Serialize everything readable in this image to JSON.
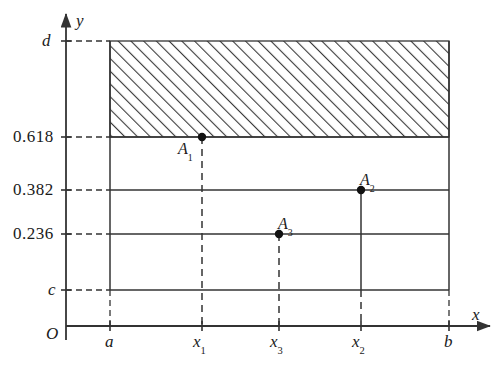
{
  "figure": {
    "type": "cartesian-diagram",
    "axes": {
      "x_label": "x",
      "y_label": "y",
      "origin_label": "O"
    },
    "y_ticks": [
      {
        "id": "d",
        "label": "d",
        "pixel_y": 41,
        "style": "italic"
      },
      {
        "id": "0.618",
        "label": "0.618",
        "pixel_y": 137,
        "style": "number"
      },
      {
        "id": "0.382",
        "label": "0.382",
        "pixel_y": 190,
        "style": "number"
      },
      {
        "id": "0.236",
        "label": "0.236",
        "pixel_y": 234,
        "style": "number"
      },
      {
        "id": "c",
        "label": "c",
        "pixel_y": 290,
        "style": "italic"
      }
    ],
    "x_ticks": [
      {
        "id": "a",
        "label": "a",
        "sub": "",
        "pixel_x": 110
      },
      {
        "id": "x1",
        "label": "x",
        "sub": "1",
        "pixel_x": 202
      },
      {
        "id": "x3",
        "label": "x",
        "sub": "3",
        "pixel_x": 279
      },
      {
        "id": "x2",
        "label": "x",
        "sub": "2",
        "pixel_x": 361
      },
      {
        "id": "b",
        "label": "b",
        "sub": "",
        "pixel_x": 449
      }
    ],
    "points": [
      {
        "id": "A1",
        "label": "A",
        "sub": "1",
        "x_tick": "x1",
        "y_tick": "0.618",
        "pixel_x": 202,
        "pixel_y": 137
      },
      {
        "id": "A2",
        "label": "A",
        "sub": "2",
        "x_tick": "x2",
        "y_tick": "0.382",
        "pixel_x": 361,
        "pixel_y": 190
      },
      {
        "id": "A3",
        "label": "A",
        "sub": "3",
        "x_tick": "x3",
        "y_tick": "0.236",
        "pixel_x": 279,
        "pixel_y": 234
      }
    ],
    "hatched_region": {
      "name": "eliminated-interval-band",
      "x_from": "a",
      "x_to": "b",
      "y_from": "0.618",
      "y_to": "d",
      "hatch_angle_deg": 45
    },
    "colors": {
      "stroke": "#333333",
      "hatch": "#3a3a3a",
      "text": "#1a1a1a",
      "background": "#ffffff"
    }
  }
}
